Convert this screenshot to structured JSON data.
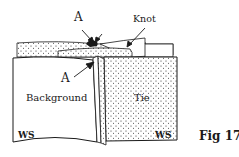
{
  "figure": {
    "caption": "Fig 17",
    "labels": {
      "a_top": "A",
      "knot": "Knot",
      "a_side": "A",
      "background": "Background",
      "tie": "Tie",
      "ws_left": "WS",
      "ws_right": "WS"
    },
    "colors": {
      "line": "#1a1a1a",
      "paper": "#ffffff",
      "stipple": "#2a2a2a"
    }
  }
}
